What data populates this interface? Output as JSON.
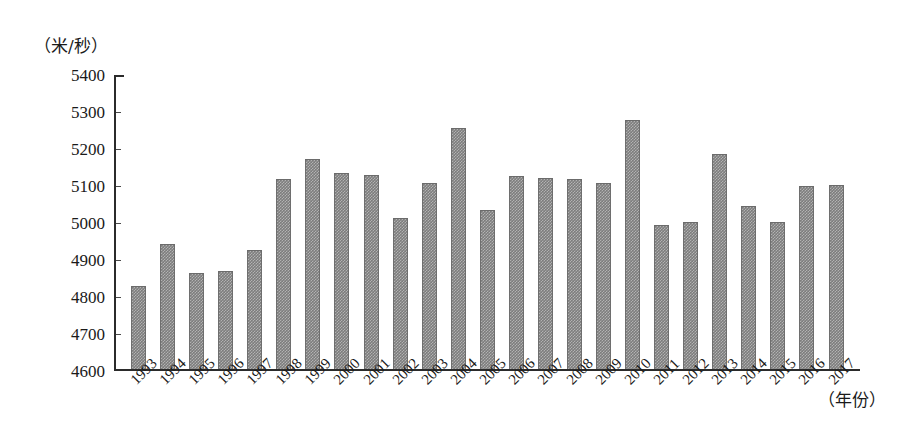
{
  "chart_data": {
    "type": "bar",
    "title": "",
    "subtitle": "",
    "xlabel": "（年份）",
    "ylabel": "（米/秒）",
    "ylim": [
      4600,
      5400
    ],
    "ytick_step": 100,
    "yticks": [
      5400,
      5300,
      5200,
      5100,
      5000,
      4900,
      4800,
      4700,
      4600
    ],
    "ytick_labels": [
      "5400",
      "5300",
      "5200",
      "5100",
      "5000",
      "4900",
      "4800",
      "4700",
      "4600"
    ],
    "grid": false,
    "legend": null,
    "bar_color": "#7d7d7d",
    "categories": [
      "1993",
      "1994",
      "1995",
      "1996",
      "1997",
      "1998",
      "1999",
      "2000",
      "2001",
      "2002",
      "2003",
      "2004",
      "2005",
      "2006",
      "2007",
      "2008",
      "2009",
      "2010",
      "2011",
      "2012",
      "2013",
      "2014",
      "2015",
      "2016",
      "2017"
    ],
    "values": [
      4824,
      4937,
      4859,
      4864,
      4920,
      5113,
      5170,
      5130,
      5125,
      5008,
      5103,
      5253,
      5031,
      5123,
      5117,
      5113,
      5104,
      5275,
      4988,
      4997,
      5182,
      5040,
      4997,
      5094,
      5097
    ]
  }
}
